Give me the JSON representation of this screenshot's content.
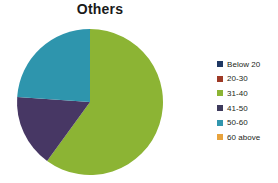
{
  "chart_data": {
    "type": "pie",
    "title": "Others",
    "xlabel": "",
    "ylabel": "",
    "legend_position": "right",
    "grid": false,
    "categories": [
      "Below 20",
      "20-30",
      "31-40",
      "41-50",
      "50-60",
      "60 above"
    ],
    "values": [
      0,
      0,
      60,
      16,
      24,
      0
    ],
    "colors": [
      "#1f3864",
      "#9e3a26",
      "#8cb434",
      "#3d3a5c",
      "#3196ae",
      "#e8a33d"
    ],
    "slices": [
      {
        "label": "Below 20",
        "value": 0,
        "color": "#1f3864",
        "start_angle": 0,
        "end_angle": 0
      },
      {
        "label": "20-30",
        "value": 0,
        "color": "#9e3a26",
        "start_angle": 0,
        "end_angle": 0
      },
      {
        "label": "31-40",
        "value": 60,
        "color": "#8cb434",
        "start_angle": 0,
        "end_angle": 216
      },
      {
        "label": "41-50",
        "value": 16,
        "color": "#473764",
        "start_angle": 216,
        "end_angle": 274
      },
      {
        "label": "50-60",
        "value": 24,
        "color": "#2e95ad",
        "start_angle": 274,
        "end_angle": 360
      },
      {
        "label": "60 above",
        "value": 0,
        "color": "#e8a33d",
        "start_angle": 360,
        "end_angle": 360
      }
    ],
    "geometry": {
      "cx": 90,
      "cy": 80,
      "r": 73
    }
  },
  "legend": {
    "items": [
      {
        "label": "Below 20",
        "color": "#1f3864"
      },
      {
        "label": "20-30",
        "color": "#9e3a26"
      },
      {
        "label": "31-40",
        "color": "#8cb434"
      },
      {
        "label": "41-50",
        "color": "#3d3a5c"
      },
      {
        "label": "50-60",
        "color": "#3196ae"
      },
      {
        "label": "60 above",
        "color": "#e8a33d"
      }
    ]
  }
}
